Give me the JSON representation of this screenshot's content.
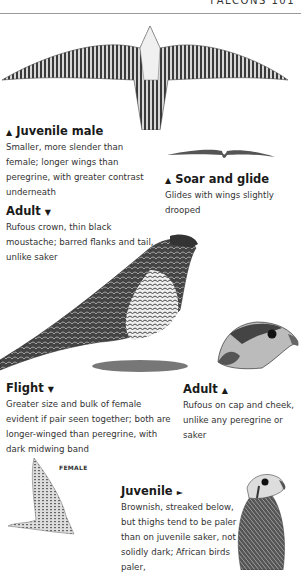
{
  "header": {
    "running_title": "FALCONS 101"
  },
  "captions": {
    "juvenile_male": {
      "pointer": "▲",
      "title": "Juvenile male",
      "text": "Smaller, more slender than female; longer wings than peregrine, with greater contrast underneath"
    },
    "soar_glide": {
      "pointer": "▲",
      "title": "Soar and glide",
      "text": "Glides with wings slightly drooped"
    },
    "adult_perched": {
      "pointer": "▼",
      "title": "Adult",
      "text": "Rufous crown, thin black moustache; barred flanks and tail, unlike saker"
    },
    "adult_head": {
      "pointer": "▲",
      "title": "Adult",
      "text": "Rufous on cap and cheek, unlike any peregrine or saker"
    },
    "flight": {
      "pointer": "▼",
      "title": "Flight",
      "text": "Greater size and bulk of female evident if pair seen together; both are longer-winged than peregrine, with dark midwing band"
    },
    "juvenile": {
      "pointer": "►",
      "title": "Juvenile",
      "text": "Brownish, streaked below, but thighs tend to be paler than on juvenile saker, not solidly dark; African birds paler,"
    }
  },
  "labels": {
    "female": "FEMALE"
  },
  "illustrations": [
    "juvenile-male-flight-underside",
    "soar-glide-silhouette",
    "adult-perched",
    "adult-head",
    "female-flight",
    "juvenile-head"
  ]
}
